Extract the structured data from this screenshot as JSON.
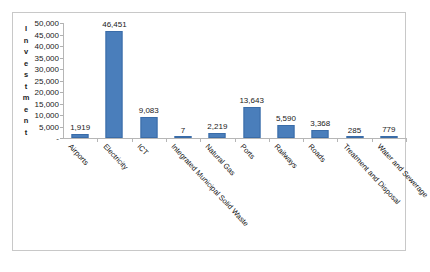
{
  "chart_data": {
    "type": "bar",
    "title": "",
    "xlabel": "",
    "ylabel": "Investment",
    "ylim": [
      0,
      50000
    ],
    "grid": false,
    "legend": "none",
    "bar_color": "#4a7ebb",
    "categories": [
      "Airports",
      "Electricity",
      "ICT",
      "Integrated Municipal Solid Waste",
      "Natural Gas",
      "Ports",
      "Railways",
      "Roads",
      "Treatment and Disposal",
      "Water and Sewerage"
    ],
    "values": [
      1919,
      46451,
      9083,
      7,
      2219,
      13643,
      5590,
      3368,
      285,
      779
    ],
    "value_labels": [
      "1,919",
      "46,451",
      "9,083",
      "7",
      "2,219",
      "13,643",
      "5,590",
      "3,368",
      "285",
      "779"
    ],
    "y_ticks": [
      0,
      5000,
      10000,
      15000,
      20000,
      25000,
      30000,
      35000,
      40000,
      45000,
      50000
    ],
    "y_tick_labels": [
      "-",
      "5,000",
      "10,000",
      "15,000",
      "20,000",
      "25,000",
      "30,000",
      "35,000",
      "40,000",
      "45,000",
      "50,000"
    ]
  },
  "axis_title_letters": [
    "I",
    "n",
    "v",
    "e",
    "s",
    "t",
    "m",
    "e",
    "n",
    "t"
  ]
}
